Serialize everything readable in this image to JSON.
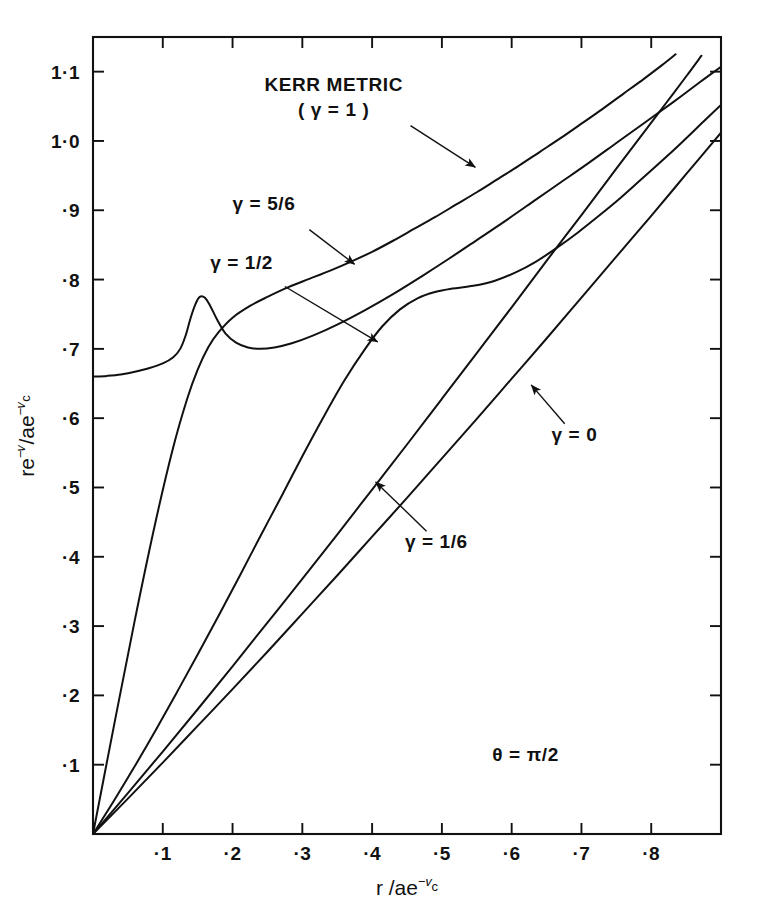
{
  "chart_data": {
    "type": "line",
    "title": "",
    "xlabel": "r /ae^-v_c",
    "ylabel": "re^-v /ae^-v_c",
    "xlim": [
      0,
      0.9
    ],
    "ylim": [
      0,
      1.15
    ],
    "grid": false,
    "legend_position": "inline-annotations",
    "xticks": [
      0.1,
      0.2,
      0.3,
      0.4,
      0.5,
      0.6,
      0.7,
      0.8
    ],
    "xticklabels": [
      "·1",
      "·2",
      "·3",
      "·4",
      "·5",
      "·6",
      "·7",
      "·8"
    ],
    "yticks": [
      0.1,
      0.2,
      0.3,
      0.4,
      0.5,
      0.6,
      0.7,
      0.8,
      0.9,
      1.0,
      1.1
    ],
    "yticklabels": [
      "·1",
      "·2",
      "·3",
      "·4",
      "·5",
      "·6",
      "·7",
      "·8",
      "·9",
      "1·0",
      "1·1"
    ],
    "annotations": [
      {
        "text": "θ = π/2",
        "x": 0.62,
        "y": 0.105
      }
    ],
    "series": [
      {
        "name": "KERR METRIC (γ = 1)",
        "gamma": "1",
        "label_line1": "KERR METRIC",
        "label_line2": "( γ = 1 )",
        "points": [
          [
            0.0,
            0.66
          ],
          [
            0.02,
            0.661
          ],
          [
            0.04,
            0.663
          ],
          [
            0.06,
            0.667
          ],
          [
            0.08,
            0.672
          ],
          [
            0.1,
            0.679
          ],
          [
            0.115,
            0.688
          ],
          [
            0.125,
            0.7
          ],
          [
            0.133,
            0.72
          ],
          [
            0.14,
            0.745
          ],
          [
            0.147,
            0.765
          ],
          [
            0.153,
            0.775
          ],
          [
            0.16,
            0.774
          ],
          [
            0.168,
            0.762
          ],
          [
            0.178,
            0.742
          ],
          [
            0.19,
            0.722
          ],
          [
            0.205,
            0.709
          ],
          [
            0.222,
            0.702
          ],
          [
            0.24,
            0.7
          ],
          [
            0.26,
            0.702
          ],
          [
            0.285,
            0.708
          ],
          [
            0.315,
            0.719
          ],
          [
            0.35,
            0.735
          ],
          [
            0.39,
            0.756
          ],
          [
            0.43,
            0.779
          ],
          [
            0.47,
            0.804
          ],
          [
            0.51,
            0.83
          ],
          [
            0.55,
            0.857
          ],
          [
            0.59,
            0.884
          ],
          [
            0.63,
            0.912
          ],
          [
            0.67,
            0.94
          ],
          [
            0.71,
            0.968
          ],
          [
            0.75,
            0.997
          ],
          [
            0.79,
            1.026
          ],
          [
            0.83,
            1.055
          ],
          [
            0.87,
            1.085
          ],
          [
            0.9,
            1.107
          ]
        ]
      },
      {
        "name": "γ = 5/6",
        "gamma": "5/6",
        "label": "γ = 5/6",
        "points": [
          [
            0.0,
            0.0
          ],
          [
            0.03,
            0.156
          ],
          [
            0.06,
            0.309
          ],
          [
            0.09,
            0.452
          ],
          [
            0.115,
            0.558
          ],
          [
            0.135,
            0.628
          ],
          [
            0.15,
            0.67
          ],
          [
            0.165,
            0.702
          ],
          [
            0.18,
            0.724
          ],
          [
            0.2,
            0.745
          ],
          [
            0.225,
            0.762
          ],
          [
            0.25,
            0.775
          ],
          [
            0.28,
            0.789
          ],
          [
            0.31,
            0.801
          ],
          [
            0.34,
            0.813
          ],
          [
            0.37,
            0.826
          ],
          [
            0.4,
            0.84
          ],
          [
            0.43,
            0.856
          ],
          [
            0.46,
            0.873
          ],
          [
            0.49,
            0.89
          ],
          [
            0.52,
            0.908
          ],
          [
            0.55,
            0.926
          ],
          [
            0.58,
            0.945
          ],
          [
            0.61,
            0.964
          ],
          [
            0.64,
            0.984
          ],
          [
            0.67,
            1.004
          ],
          [
            0.7,
            1.025
          ],
          [
            0.73,
            1.046
          ],
          [
            0.76,
            1.068
          ],
          [
            0.79,
            1.09
          ],
          [
            0.815,
            1.109
          ],
          [
            0.835,
            1.125
          ]
        ]
      },
      {
        "name": "γ = 1/2",
        "gamma": "1/2",
        "label": "γ =  1/2",
        "points": [
          [
            0.0,
            0.0
          ],
          [
            0.03,
            0.048
          ],
          [
            0.06,
            0.098
          ],
          [
            0.09,
            0.15
          ],
          [
            0.12,
            0.204
          ],
          [
            0.15,
            0.259
          ],
          [
            0.18,
            0.315
          ],
          [
            0.21,
            0.372
          ],
          [
            0.24,
            0.43
          ],
          [
            0.27,
            0.487
          ],
          [
            0.3,
            0.545
          ],
          [
            0.33,
            0.601
          ],
          [
            0.36,
            0.654
          ],
          [
            0.39,
            0.7
          ],
          [
            0.415,
            0.733
          ],
          [
            0.44,
            0.757
          ],
          [
            0.465,
            0.773
          ],
          [
            0.49,
            0.782
          ],
          [
            0.515,
            0.787
          ],
          [
            0.545,
            0.791
          ],
          [
            0.575,
            0.798
          ],
          [
            0.605,
            0.81
          ],
          [
            0.635,
            0.826
          ],
          [
            0.665,
            0.846
          ],
          [
            0.695,
            0.868
          ],
          [
            0.725,
            0.892
          ],
          [
            0.755,
            0.917
          ],
          [
            0.785,
            0.944
          ],
          [
            0.815,
            0.971
          ],
          [
            0.845,
            0.999
          ],
          [
            0.875,
            1.028
          ],
          [
            0.9,
            1.052
          ]
        ]
      },
      {
        "name": "γ = 1/6",
        "gamma": "1/6",
        "label": "γ = 1/6",
        "points": [
          [
            0.0,
            0.0
          ],
          [
            0.05,
            0.059
          ],
          [
            0.1,
            0.119
          ],
          [
            0.15,
            0.18
          ],
          [
            0.2,
            0.242
          ],
          [
            0.25,
            0.305
          ],
          [
            0.3,
            0.368
          ],
          [
            0.35,
            0.432
          ],
          [
            0.4,
            0.497
          ],
          [
            0.45,
            0.562
          ],
          [
            0.5,
            0.628
          ],
          [
            0.55,
            0.694
          ],
          [
            0.6,
            0.76
          ],
          [
            0.65,
            0.827
          ],
          [
            0.7,
            0.893
          ],
          [
            0.75,
            0.96
          ],
          [
            0.79,
            1.013
          ],
          [
            0.82,
            1.053
          ],
          [
            0.85,
            1.093
          ],
          [
            0.872,
            1.123
          ]
        ]
      },
      {
        "name": "γ = 0",
        "gamma": "0",
        "label": "γ = 0",
        "points": [
          [
            0.0,
            0.0
          ],
          [
            0.05,
            0.051
          ],
          [
            0.1,
            0.103
          ],
          [
            0.15,
            0.156
          ],
          [
            0.2,
            0.209
          ],
          [
            0.25,
            0.263
          ],
          [
            0.3,
            0.318
          ],
          [
            0.35,
            0.373
          ],
          [
            0.4,
            0.429
          ],
          [
            0.45,
            0.485
          ],
          [
            0.5,
            0.542
          ],
          [
            0.55,
            0.599
          ],
          [
            0.6,
            0.657
          ],
          [
            0.65,
            0.715
          ],
          [
            0.7,
            0.774
          ],
          [
            0.75,
            0.833
          ],
          [
            0.8,
            0.892
          ],
          [
            0.85,
            0.952
          ],
          [
            0.9,
            1.012
          ]
        ]
      }
    ],
    "callouts": [
      {
        "series": "KERR METRIC (γ = 1)",
        "label_x": 0.345,
        "label_y": 1.072,
        "from_x": 0.455,
        "from_y": 1.022,
        "to_x": 0.548,
        "to_y": 0.962
      },
      {
        "series": "γ = 5/6",
        "label_x": 0.245,
        "label_y": 0.9,
        "from_x": 0.31,
        "from_y": 0.872,
        "to_x": 0.375,
        "to_y": 0.822
      },
      {
        "series": "γ = 1/2",
        "label_x": 0.213,
        "label_y": 0.815,
        "from_x": 0.275,
        "from_y": 0.79,
        "to_x": 0.408,
        "to_y": 0.71
      },
      {
        "series": "γ = 1/6",
        "label_x": 0.492,
        "label_y": 0.412,
        "from_x": 0.478,
        "from_y": 0.437,
        "to_x": 0.405,
        "to_y": 0.508
      },
      {
        "series": "γ = 0",
        "label_x": 0.69,
        "label_y": 0.567,
        "from_x": 0.676,
        "from_y": 0.592,
        "to_x": 0.628,
        "to_y": 0.648
      }
    ]
  }
}
